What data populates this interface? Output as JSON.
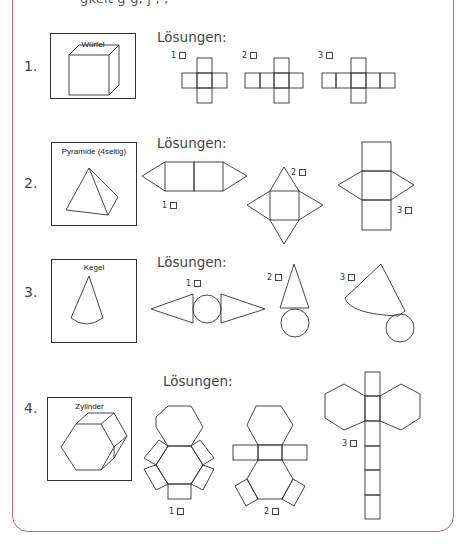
{
  "page": {
    "cut_text": "gkeit g g, j    ,        ,",
    "frame_color": "#c86a6a",
    "solutions_label": "Lösungen:"
  },
  "tasks": [
    {
      "number": "1.",
      "shape": "Würfel",
      "options": [
        {
          "label": "1",
          "checked": false
        },
        {
          "label": "2",
          "checked": false
        },
        {
          "label": "3",
          "checked": false
        }
      ]
    },
    {
      "number": "2.",
      "shape": "Pyramide (4seitig)",
      "options": [
        {
          "label": "1",
          "checked": false
        },
        {
          "label": "2",
          "checked": false
        },
        {
          "label": "3",
          "checked": false
        }
      ]
    },
    {
      "number": "3.",
      "shape": "Kegel",
      "options": [
        {
          "label": "1",
          "checked": false
        },
        {
          "label": "2",
          "checked": false
        },
        {
          "label": "3",
          "checked": false
        }
      ]
    },
    {
      "number": "4.",
      "shape": "Zylinder",
      "options": [
        {
          "label": "1",
          "checked": false
        },
        {
          "label": "2",
          "checked": false
        },
        {
          "label": "3",
          "checked": false
        }
      ]
    }
  ]
}
